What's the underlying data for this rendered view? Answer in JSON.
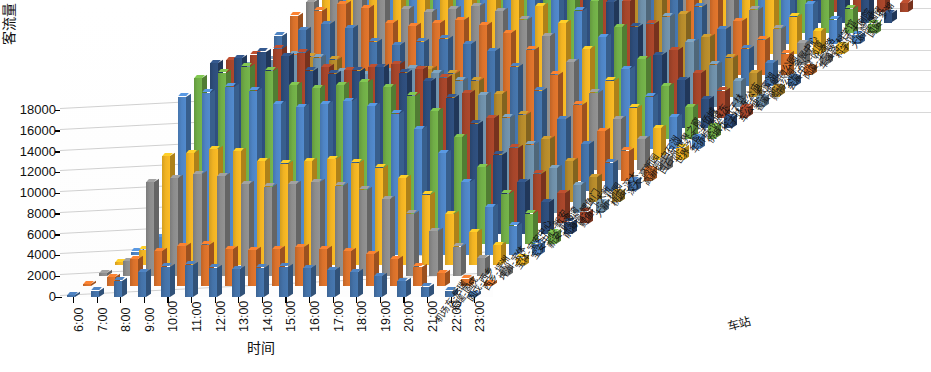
{
  "chart_data": {
    "type": "bar",
    "subtype": "3d-column",
    "title": "",
    "xlabel": "时间",
    "ylabel": "客流量（人次）",
    "zlabel": "车站",
    "ylim": [
      0,
      18000
    ],
    "ytick_labels": [
      "18000",
      "16000",
      "14000",
      "12000",
      "10000",
      "8000",
      "6000",
      "4000",
      "2000",
      "0"
    ],
    "ytick_values": [
      18000,
      16000,
      14000,
      12000,
      10000,
      8000,
      6000,
      4000,
      2000,
      0
    ],
    "grid": true,
    "legend": "none",
    "categories": [
      "6:00",
      "7:00",
      "8:00",
      "9:00",
      "10:00",
      "11:00",
      "12:00",
      "13:00",
      "14:00",
      "15:00",
      "16:00",
      "17:00",
      "18:00",
      "19:00",
      "20:00",
      "21:00",
      "22:00",
      "23:00"
    ],
    "series": [
      {
        "name": "机场东-后瑞",
        "color": "#4472a8",
        "values": [
          180,
          620,
          1550,
          2400,
          2900,
          3100,
          2800,
          2700,
          2800,
          2900,
          2750,
          2600,
          2400,
          2000,
          1500,
          1000,
          620,
          260
        ]
      },
      {
        "name": "后瑞-固戍",
        "color": "#d9712b",
        "values": [
          210,
          900,
          2600,
          3400,
          3900,
          4000,
          3600,
          3500,
          3600,
          3800,
          3600,
          3400,
          3100,
          2600,
          1900,
          1250,
          760,
          300
        ]
      },
      {
        "name": "固戍-西乡",
        "color": "#8c8c8c",
        "values": [
          260,
          1400,
          9000,
          9400,
          9800,
          9600,
          8800,
          8600,
          8800,
          9000,
          8700,
          8300,
          7400,
          6000,
          4300,
          2800,
          1700,
          660
        ]
      },
      {
        "name": "西乡-坪洲",
        "color": "#f0b323",
        "values": [
          280,
          1500,
          10500,
          10800,
          11200,
          11000,
          10000,
          9800,
          10000,
          10200,
          9900,
          9400,
          8400,
          6800,
          4900,
          3200,
          1950,
          750
        ]
      },
      {
        "name": "坪洲-宝体",
        "color": "#4e84c4",
        "values": [
          300,
          1700,
          15200,
          15600,
          16200,
          15800,
          14500,
          14200,
          14500,
          14800,
          14300,
          13600,
          12100,
          9800,
          7000,
          4600,
          2800,
          1080
        ]
      },
      {
        "name": "宝体-宝安中心",
        "color": "#70ad47",
        "values": [
          320,
          1800,
          16000,
          16500,
          17100,
          16700,
          15300,
          15000,
          15300,
          15600,
          15100,
          14300,
          12800,
          10300,
          7400,
          4850,
          2950,
          1140
        ]
      },
      {
        "name": "宝安中心-新安",
        "color": "#2e4d7b",
        "values": [
          330,
          1850,
          16400,
          16900,
          17500,
          17100,
          15700,
          15400,
          15700,
          16000,
          15500,
          14700,
          13100,
          10600,
          7600,
          4980,
          3020,
          1170
        ]
      },
      {
        "name": "新安-前海湾",
        "color": "#a5452a",
        "values": [
          310,
          1750,
          15700,
          16200,
          16800,
          16400,
          15000,
          14700,
          15000,
          15300,
          14800,
          14000,
          12500,
          10100,
          7250,
          4750,
          2880,
          1110
        ]
      },
      {
        "name": "前海湾-鲤鱼门",
        "color": "#6e8fa8",
        "values": [
          290,
          1600,
          14200,
          14700,
          15200,
          14900,
          13600,
          13300,
          13600,
          13900,
          13400,
          12700,
          11300,
          9150,
          6550,
          4300,
          2610,
          1010
        ]
      },
      {
        "name": "鲤鱼门-大新",
        "color": "#b58a2b",
        "values": [
          270,
          1500,
          13000,
          13500,
          14000,
          13700,
          12500,
          12200,
          12500,
          12800,
          12350,
          11700,
          10400,
          8400,
          6030,
          3950,
          2400,
          925
        ]
      },
      {
        "name": "大新-桃园",
        "color": "#4472a8",
        "values": [
          300,
          1700,
          15000,
          15500,
          16100,
          15700,
          14400,
          14100,
          14400,
          14700,
          14200,
          13500,
          12000,
          9700,
          6950,
          4560,
          2770,
          1070
        ]
      },
      {
        "name": "桃园-深大",
        "color": "#d9712b",
        "values": [
          310,
          1780,
          15900,
          16400,
          17000,
          16600,
          15200,
          14900,
          15200,
          15500,
          15000,
          14200,
          12650,
          10230,
          7330,
          4810,
          2920,
          1130
        ]
      },
      {
        "name": "深大-高新园",
        "color": "#8c8c8c",
        "values": [
          320,
          1800,
          16200,
          16700,
          17300,
          16900,
          15500,
          15200,
          15500,
          15800,
          15300,
          14500,
          12900,
          10430,
          7470,
          4900,
          2975,
          1150
        ]
      },
      {
        "name": "高新园-白石洲",
        "color": "#f0b323",
        "values": [
          330,
          1850,
          16500,
          17000,
          17600,
          17200,
          15800,
          15500,
          15800,
          16100,
          15600,
          14800,
          13180,
          10650,
          7630,
          5010,
          3040,
          1175
        ]
      },
      {
        "name": "白石洲-世界之窗",
        "color": "#4e84c4",
        "values": [
          340,
          1880,
          16700,
          17200,
          17800,
          17400,
          16000,
          15700,
          16000,
          16300,
          15800,
          15000,
          13350,
          10790,
          7730,
          5075,
          3080,
          1190
        ]
      },
      {
        "name": "世界之窗-华侨城",
        "color": "#70ad47",
        "values": [
          335,
          1860,
          16600,
          17100,
          17700,
          17300,
          15900,
          15600,
          15900,
          16200,
          15700,
          14900,
          13260,
          10720,
          7680,
          5040,
          3060,
          1182
        ]
      },
      {
        "name": "华侨城-侨城东",
        "color": "#2e4d7b",
        "values": [
          300,
          1700,
          15100,
          15600,
          16200,
          15800,
          14500,
          14200,
          14500,
          14800,
          14300,
          13600,
          12100,
          9780,
          7010,
          4600,
          2790,
          1078
        ]
      },
      {
        "name": "侨城东-竹子林",
        "color": "#a5452a",
        "values": [
          280,
          1600,
          14000,
          14500,
          15000,
          14700,
          13400,
          13100,
          13400,
          13700,
          13250,
          12570,
          11190,
          9050,
          6480,
          4250,
          2580,
          998
        ]
      },
      {
        "name": "竹子林-车公庙",
        "color": "#6e8fa8",
        "values": [
          270,
          1550,
          13500,
          13950,
          14450,
          14150,
          12900,
          12620,
          12900,
          13180,
          12750,
          12100,
          10770,
          8710,
          6240,
          4090,
          2480,
          960
        ]
      },
      {
        "name": "车公庙-香蜜湖",
        "color": "#b58a2b",
        "values": [
          250,
          1420,
          12300,
          12720,
          13180,
          12900,
          11760,
          11500,
          11760,
          12020,
          11620,
          11030,
          9820,
          7940,
          5690,
          3730,
          2265,
          875
        ]
      },
      {
        "name": "香蜜湖-购物公园",
        "color": "#4472a8",
        "values": [
          240,
          1360,
          11800,
          12200,
          12640,
          12370,
          11280,
          11030,
          11280,
          11530,
          11150,
          10580,
          9420,
          7620,
          5460,
          3580,
          2170,
          840
        ]
      },
      {
        "name": "购物公园-会展中心",
        "color": "#d9712b",
        "values": [
          230,
          1310,
          11300,
          11690,
          12110,
          11850,
          10810,
          10570,
          10810,
          11050,
          10680,
          10140,
          9030,
          7300,
          5230,
          3430,
          2080,
          805
        ]
      },
      {
        "name": "会展中心-岗厦",
        "color": "#8c8c8c",
        "values": [
          235,
          1330,
          11500,
          11890,
          12320,
          12060,
          11000,
          10750,
          11000,
          11240,
          10870,
          10310,
          9180,
          7420,
          5320,
          3490,
          2115,
          818
        ]
      },
      {
        "name": "岗厦-华强路",
        "color": "#f0b323",
        "values": [
          245,
          1390,
          12000,
          12410,
          12860,
          12590,
          11480,
          11220,
          11480,
          11730,
          11340,
          10760,
          9580,
          7750,
          5550,
          3640,
          2210,
          855
        ]
      },
      {
        "name": "华强路-科学馆",
        "color": "#4e84c4",
        "values": [
          255,
          1450,
          12500,
          12930,
          13390,
          13110,
          11960,
          11690,
          11960,
          12220,
          11810,
          11210,
          9980,
          8070,
          5780,
          3790,
          2300,
          890
        ]
      },
      {
        "name": "科学馆-大剧院",
        "color": "#70ad47",
        "values": [
          265,
          1500,
          12900,
          13340,
          13820,
          13530,
          12340,
          12060,
          12340,
          12610,
          12190,
          11570,
          10300,
          8330,
          5970,
          3910,
          2375,
          918
        ]
      },
      {
        "name": "大剧院-国贸",
        "color": "#2e4d7b",
        "values": [
          260,
          1480,
          12700,
          13140,
          13610,
          13320,
          12150,
          11880,
          12150,
          12420,
          12000,
          11390,
          10140,
          8200,
          5870,
          3850,
          2340,
          905
        ]
      },
      {
        "name": "国贸-罗湖",
        "color": "#a5452a",
        "values": [
          240,
          1370,
          11900,
          12310,
          12750,
          12480,
          11390,
          11130,
          11390,
          11640,
          11250,
          10670,
          9500,
          7680,
          5500,
          3610,
          2190,
          848
        ]
      }
    ],
    "depth_labels": [
      "机场东-后瑞",
      "后瑞-固戍",
      "固戍-西乡",
      "西乡-坪洲",
      "坪洲-宝体",
      "宝体-宝安中心",
      "宝安中心-新安",
      "新安-前海湾",
      "前海湾-鲤鱼门",
      "鲤鱼门-大新",
      "大新-桃园",
      "桃园-深大",
      "深大-高新园",
      "高新园-白石洲",
      "白石洲-世界之窗",
      "世界之窗-华侨城",
      "华侨城-侨城东",
      "侨城东-竹子林",
      "竹子林-车公庙",
      "车公庙-香蜜湖",
      "香蜜湖-购物公园",
      "购物公园-会展中心",
      "会展中心-岗厦",
      "岗厦-华强路",
      "华强路-科学馆",
      "科学馆-大剧院",
      "大剧院-国贸",
      "国贸-罗湖"
    ],
    "colors": [
      "#4472a8",
      "#d9712b",
      "#8c8c8c",
      "#f0b323",
      "#4e84c4",
      "#70ad47",
      "#2e4d7b",
      "#a5452a",
      "#6e8fa8",
      "#b58a2b"
    ]
  }
}
